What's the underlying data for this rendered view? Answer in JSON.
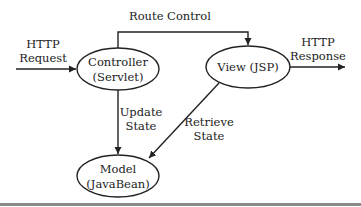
{
  "diagram": {
    "nodes": [
      {
        "id": "controller",
        "line1": "Controller",
        "line2": "(Servlet)"
      },
      {
        "id": "view",
        "line1": "View (JSP)"
      },
      {
        "id": "model",
        "line1": "Model",
        "line2": "(JavaBean)"
      }
    ],
    "edges": [
      {
        "from": "external",
        "to": "controller",
        "line1": "HTTP",
        "line2": "Request"
      },
      {
        "from": "controller",
        "to": "view",
        "label": "Route Control"
      },
      {
        "from": "view",
        "to": "external",
        "line1": "HTTP",
        "line2": "Response"
      },
      {
        "from": "controller",
        "to": "model",
        "line1": "Update",
        "line2": "State"
      },
      {
        "from": "view",
        "to": "model",
        "line1": "Retrieve",
        "line2": "State"
      }
    ]
  }
}
